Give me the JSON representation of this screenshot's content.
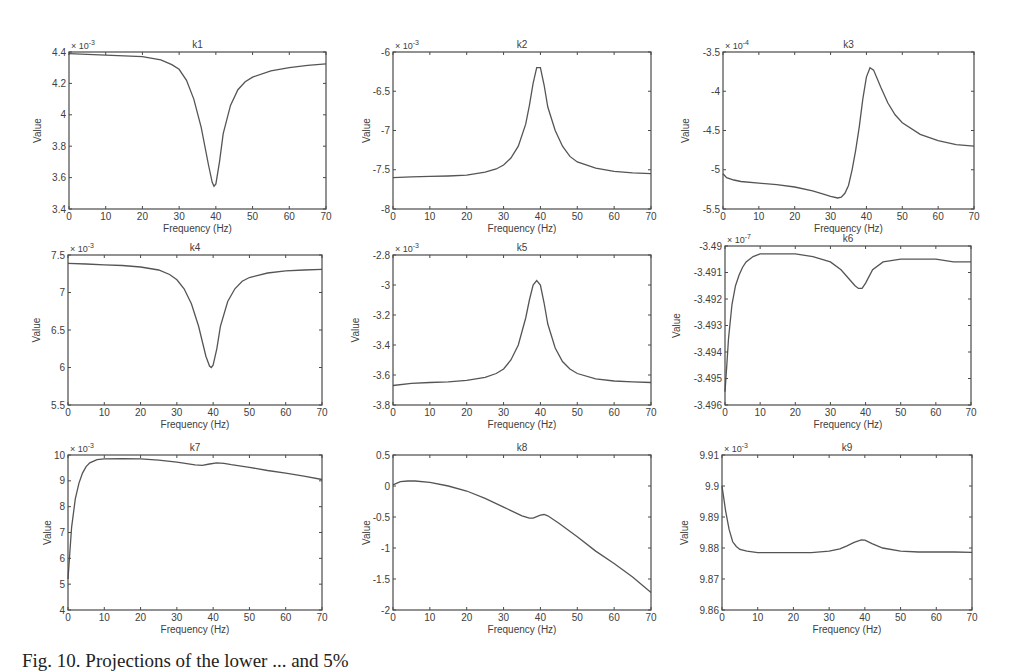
{
  "figure": {
    "caption": "Fig. 10. Projections of the lower ... and 5%"
  },
  "chart_data": [
    {
      "id": "k1",
      "type": "line",
      "title": "k1",
      "xlabel": "Frequency (Hz)",
      "ylabel": "Value",
      "multiplier": "x 10^-3",
      "xlim": [
        0,
        70
      ],
      "ylim": [
        3.4,
        4.4
      ],
      "xticks": [
        0,
        10,
        20,
        30,
        40,
        50,
        60,
        70
      ],
      "yticks": [
        3.4,
        3.6,
        3.8,
        4,
        4.2,
        4.4
      ],
      "ytick_labels": [
        "3.4",
        "3.6",
        "3.8",
        "4",
        "4.2",
        "4.4"
      ],
      "x": [
        0,
        5,
        10,
        15,
        20,
        25,
        28,
        30,
        32,
        34,
        36,
        38,
        39,
        39.5,
        40,
        41,
        42,
        44,
        46,
        48,
        50,
        55,
        60,
        65,
        70
      ],
      "y": [
        4.39,
        4.385,
        4.38,
        4.375,
        4.37,
        4.35,
        4.32,
        4.29,
        4.22,
        4.1,
        3.92,
        3.68,
        3.57,
        3.545,
        3.56,
        3.7,
        3.88,
        4.06,
        4.16,
        4.21,
        4.24,
        4.28,
        4.3,
        4.315,
        4.325
      ],
      "grid": false
    },
    {
      "id": "k2",
      "type": "line",
      "title": "k2",
      "xlabel": "Frequency (Hz)",
      "ylabel": "Value",
      "multiplier": "x 10^-3",
      "xlim": [
        0,
        70
      ],
      "ylim": [
        -8,
        -6
      ],
      "xticks": [
        0,
        10,
        20,
        30,
        40,
        50,
        60,
        70
      ],
      "yticks": [
        -8,
        -7.5,
        -7,
        -6.5,
        -6
      ],
      "ytick_labels": [
        "-8",
        "-7.5",
        "-7",
        "-6.5",
        "-6"
      ],
      "x": [
        0,
        5,
        10,
        15,
        20,
        25,
        28,
        30,
        32,
        34,
        36,
        37,
        38,
        39,
        40,
        41,
        42,
        44,
        46,
        48,
        50,
        55,
        60,
        65,
        70
      ],
      "y": [
        -7.6,
        -7.59,
        -7.585,
        -7.58,
        -7.57,
        -7.53,
        -7.49,
        -7.44,
        -7.35,
        -7.2,
        -6.92,
        -6.68,
        -6.4,
        -6.2,
        -6.2,
        -6.42,
        -6.7,
        -7.0,
        -7.2,
        -7.33,
        -7.4,
        -7.48,
        -7.52,
        -7.54,
        -7.55
      ],
      "grid": false
    },
    {
      "id": "k3",
      "type": "line",
      "title": "k3",
      "xlabel": "Frequency (Hz)",
      "ylabel": "Value",
      "multiplier": "x 10^-4",
      "xlim": [
        0,
        70
      ],
      "ylim": [
        -5.5,
        -3.5
      ],
      "xticks": [
        0,
        10,
        20,
        30,
        40,
        50,
        60,
        70
      ],
      "yticks": [
        -5.5,
        -5,
        -4.5,
        -4,
        -3.5
      ],
      "ytick_labels": [
        "-5.5",
        "-5",
        "-4.5",
        "-4",
        "-3.5"
      ],
      "x": [
        0,
        1,
        3,
        5,
        10,
        15,
        20,
        25,
        28,
        30,
        32,
        33,
        34,
        35,
        36,
        37,
        38,
        39,
        40,
        41,
        42,
        44,
        46,
        48,
        50,
        55,
        60,
        65,
        70
      ],
      "y": [
        -5.05,
        -5.1,
        -5.13,
        -5.15,
        -5.17,
        -5.19,
        -5.22,
        -5.27,
        -5.31,
        -5.34,
        -5.36,
        -5.35,
        -5.3,
        -5.2,
        -5.0,
        -4.75,
        -4.45,
        -4.1,
        -3.82,
        -3.7,
        -3.73,
        -3.95,
        -4.15,
        -4.3,
        -4.4,
        -4.55,
        -4.63,
        -4.68,
        -4.7
      ],
      "grid": false
    },
    {
      "id": "k4",
      "type": "line",
      "title": "k4",
      "xlabel": "Frequency (Hz)",
      "ylabel": "Value",
      "multiplier": "x 10^-3",
      "xlim": [
        0,
        70
      ],
      "ylim": [
        5.5,
        7.5
      ],
      "xticks": [
        0,
        10,
        20,
        30,
        40,
        50,
        60,
        70
      ],
      "yticks": [
        5.5,
        6,
        6.5,
        7,
        7.5
      ],
      "ytick_labels": [
        "5.5",
        "6",
        "6.5",
        "7",
        "7.5"
      ],
      "x": [
        0,
        5,
        10,
        15,
        20,
        25,
        28,
        30,
        32,
        34,
        36,
        38,
        39,
        39.5,
        40,
        41,
        42,
        44,
        46,
        48,
        50,
        55,
        60,
        65,
        70
      ],
      "y": [
        7.39,
        7.38,
        7.37,
        7.36,
        7.34,
        7.3,
        7.24,
        7.17,
        7.05,
        6.85,
        6.55,
        6.15,
        6.02,
        6.0,
        6.03,
        6.25,
        6.55,
        6.88,
        7.05,
        7.15,
        7.2,
        7.26,
        7.29,
        7.3,
        7.31
      ],
      "grid": false
    },
    {
      "id": "k5",
      "type": "line",
      "title": "k5",
      "xlabel": "Frequency (Hz)",
      "ylabel": "Value",
      "multiplier": "x 10^-3",
      "xlim": [
        0,
        70
      ],
      "ylim": [
        -3.8,
        -2.8
      ],
      "xticks": [
        0,
        10,
        20,
        30,
        40,
        50,
        60,
        70
      ],
      "yticks": [
        -3.8,
        -3.6,
        -3.4,
        -3.2,
        -3,
        -2.8
      ],
      "ytick_labels": [
        "-3.8",
        "-3.6",
        "-3.4",
        "-3.2",
        "-3",
        "-2.8"
      ],
      "x": [
        0,
        5,
        10,
        15,
        20,
        25,
        28,
        30,
        32,
        34,
        36,
        37,
        38,
        39,
        40,
        41,
        42,
        44,
        46,
        48,
        50,
        55,
        60,
        65,
        70
      ],
      "y": [
        -3.67,
        -3.655,
        -3.65,
        -3.645,
        -3.635,
        -3.615,
        -3.59,
        -3.56,
        -3.5,
        -3.4,
        -3.22,
        -3.1,
        -3.0,
        -2.97,
        -3.0,
        -3.12,
        -3.26,
        -3.42,
        -3.51,
        -3.56,
        -3.59,
        -3.625,
        -3.64,
        -3.645,
        -3.65
      ],
      "grid": false
    },
    {
      "id": "k6",
      "type": "line",
      "title": "k6",
      "xlabel": "Frequency (Hz)",
      "ylabel": "Value",
      "multiplier": "x 10^-7",
      "xlim": [
        0,
        70
      ],
      "ylim": [
        -3.496,
        -3.49
      ],
      "xticks": [
        0,
        10,
        20,
        30,
        40,
        50,
        60,
        70
      ],
      "yticks": [
        -3.496,
        -3.495,
        -3.494,
        -3.493,
        -3.492,
        -3.491,
        -3.49
      ],
      "ytick_labels": [
        "-3.496",
        "-3.495",
        "-3.494",
        "-3.493",
        "-3.492",
        "-3.491",
        "-3.49"
      ],
      "x": [
        0,
        0.5,
        1,
        2,
        3,
        4,
        5,
        6,
        8,
        10,
        15,
        20,
        25,
        30,
        33,
        35,
        37,
        38,
        39,
        40,
        42,
        45,
        50,
        55,
        60,
        65,
        70
      ],
      "y": [
        -3.4955,
        -3.4945,
        -3.4935,
        -3.4922,
        -3.4915,
        -3.4911,
        -3.4908,
        -3.4906,
        -3.4904,
        -3.4903,
        -3.4903,
        -3.4903,
        -3.4904,
        -3.4906,
        -3.4909,
        -3.4912,
        -3.4915,
        -3.4916,
        -3.4916,
        -3.4914,
        -3.4909,
        -3.4906,
        -3.4905,
        -3.4905,
        -3.4905,
        -3.4906,
        -3.4906
      ],
      "grid": false
    },
    {
      "id": "k7",
      "type": "line",
      "title": "k7",
      "xlabel": "Frequency (Hz)",
      "ylabel": "Value",
      "multiplier": "x 10^-3",
      "xlim": [
        0,
        70
      ],
      "ylim": [
        4,
        10
      ],
      "xticks": [
        0,
        10,
        20,
        30,
        40,
        50,
        60,
        70
      ],
      "yticks": [
        4,
        5,
        6,
        7,
        8,
        9,
        10
      ],
      "ytick_labels": [
        "4",
        "5",
        "6",
        "7",
        "8",
        "9",
        "10"
      ],
      "x": [
        0,
        0.5,
        1,
        2,
        3,
        4,
        5,
        6,
        8,
        10,
        15,
        20,
        25,
        30,
        35,
        37,
        39,
        41,
        43,
        45,
        50,
        55,
        60,
        65,
        70
      ],
      "y": [
        5.2,
        6.2,
        7.2,
        8.3,
        8.9,
        9.3,
        9.55,
        9.7,
        9.82,
        9.85,
        9.86,
        9.85,
        9.8,
        9.72,
        9.62,
        9.6,
        9.65,
        9.7,
        9.68,
        9.63,
        9.52,
        9.4,
        9.3,
        9.18,
        9.05
      ],
      "grid": false
    },
    {
      "id": "k8",
      "type": "line",
      "title": "k8",
      "xlabel": "Frequency (Hz)",
      "ylabel": "Value",
      "multiplier": "",
      "xlim": [
        0,
        70
      ],
      "ylim": [
        -2,
        0.5
      ],
      "xticks": [
        0,
        10,
        20,
        30,
        40,
        50,
        60,
        70
      ],
      "yticks": [
        -2,
        -1.5,
        -1,
        -0.5,
        0,
        0.5
      ],
      "ytick_labels": [
        "-2",
        "-1.5",
        "-1",
        "-0.5",
        "0",
        "0.5"
      ],
      "x": [
        0,
        2,
        4,
        6,
        10,
        15,
        20,
        25,
        30,
        35,
        37,
        38,
        40,
        41,
        42,
        45,
        50,
        55,
        60,
        65,
        70
      ],
      "y": [
        0.02,
        0.07,
        0.08,
        0.08,
        0.06,
        0.0,
        -0.08,
        -0.2,
        -0.34,
        -0.48,
        -0.52,
        -0.52,
        -0.47,
        -0.46,
        -0.48,
        -0.6,
        -0.82,
        -1.05,
        -1.25,
        -1.47,
        -1.72
      ],
      "grid": false
    },
    {
      "id": "k9",
      "type": "line",
      "title": "k9",
      "xlabel": "Frequency (Hz)",
      "ylabel": "Value",
      "multiplier": "x 10^-3",
      "xlim": [
        0,
        70
      ],
      "ylim": [
        9.86,
        9.91
      ],
      "xticks": [
        0,
        10,
        20,
        30,
        40,
        50,
        60,
        70
      ],
      "yticks": [
        9.86,
        9.87,
        9.88,
        9.89,
        9.9,
        9.91
      ],
      "ytick_labels": [
        "9.86",
        "9.87",
        "9.88",
        "9.89",
        "9.9",
        "9.91"
      ],
      "x": [
        0,
        0.5,
        1,
        2,
        3,
        4,
        5,
        7,
        10,
        15,
        20,
        25,
        30,
        33,
        35,
        37,
        39,
        40,
        42,
        45,
        50,
        55,
        60,
        65,
        70
      ],
      "y": [
        9.9,
        9.896,
        9.892,
        9.886,
        9.882,
        9.8805,
        9.8795,
        9.879,
        9.8785,
        9.8785,
        9.8785,
        9.8785,
        9.879,
        9.8797,
        9.8807,
        9.8818,
        9.8826,
        9.8825,
        9.8814,
        9.88,
        9.879,
        9.8787,
        9.8787,
        9.8787,
        9.8786
      ],
      "grid": false
    }
  ]
}
